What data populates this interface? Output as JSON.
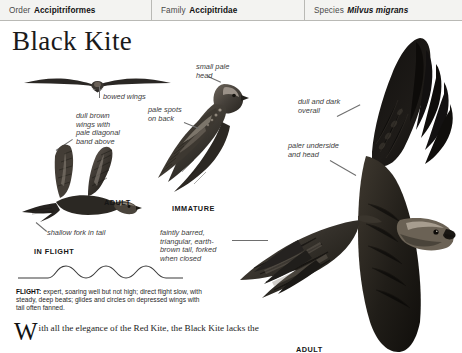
{
  "taxonomy": {
    "order": {
      "rank": "Order",
      "name": "Accipitriformes"
    },
    "family": {
      "rank": "Family",
      "name": "Accipitridae"
    },
    "species": {
      "rank": "Species",
      "name": "Milvus migrans"
    }
  },
  "title": "Black Kite",
  "annotations": {
    "bowed_wings": "bowed wings",
    "small_pale_head": "small pale\nhead",
    "dull_brown_wings": "dull brown\nwings with\npale diagonal\nband above",
    "pale_spots_on_back": "pale spots\non back",
    "dull_and_dark": "dull and dark\noverall",
    "paler_underside": "paler underside\nand head",
    "shallow_fork": "shallow fork in tail",
    "faintly_barred": "faintly barred,\ntriangular, earth-\nbrown tail, forked\nwhen closed"
  },
  "captions": {
    "adult_left": "ADULT",
    "in_flight": "IN FLIGHT",
    "immature": "IMMATURE",
    "adult_right": "ADULT"
  },
  "flight": {
    "label": "FLIGHT:",
    "text": "expert, soaring well but not high; direct flight slow, with steady, deep beats; glides and circles on depressed wings with tail often fanned."
  },
  "body": {
    "dropcap": "W",
    "text": "ith all the elegance of the Red Kite, the Black Kite lacks the"
  },
  "colors": {
    "header_bg": "#f3f3f1",
    "header_border": "#b9b9b5",
    "page_bg": "#ffffff",
    "ink": "#1a1a1a",
    "anno_ink": "#3d3d3d",
    "bird_dark": "#1c1a18",
    "bird_mid": "#4b453f",
    "bird_light": "#8d857b"
  }
}
